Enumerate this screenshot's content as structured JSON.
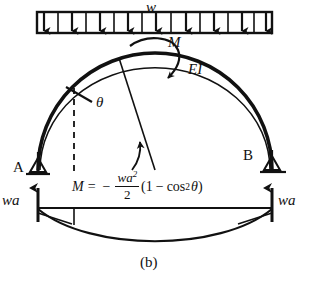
{
  "figure": {
    "caption": "(b)"
  },
  "labels": {
    "load_intensity": "w",
    "moment_arrow": "M",
    "flexural_rigidity": "EI",
    "angle": "θ",
    "support_a": "A",
    "support_b": "B",
    "reaction_left": "wa",
    "reaction_right": "wa"
  },
  "equation": {
    "lhs": "M",
    "equals": "=",
    "sign": "−",
    "numerator": "wa",
    "numerator_exponent": "2",
    "denominator": "2",
    "open_paren": "(",
    "one": "1",
    "minus": "−",
    "cos": "cos",
    "cos_exponent": "2",
    "theta": "θ",
    "close_paren": ")",
    "full_text": "M = - (wa^2 / 2)(1 - cos^2 θ)"
  },
  "load": {
    "arrow_count": 9,
    "box_left": 37,
    "box_right": 272,
    "box_top": 12,
    "box_bottom": 33
  },
  "colors": {
    "ink": "#111111",
    "background": "#ffffff"
  }
}
